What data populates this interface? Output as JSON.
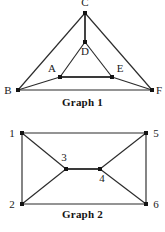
{
  "figure": {
    "background_color": "#ffffff",
    "line_color": "#2b2b2b",
    "vertex_color": "#141414",
    "label_color": "#1a1a1a",
    "width": 165,
    "height": 232
  },
  "graph_1": {
    "caption": "Graph 1",
    "vertices": [
      {
        "id": "C",
        "label": "C",
        "x": 85,
        "y": 13,
        "label_x": 85,
        "label_y": 6,
        "label_anchor": "middle"
      },
      {
        "id": "D",
        "label": "D",
        "x": 85,
        "y": 42,
        "label_x": 85,
        "label_y": 55,
        "label_anchor": "middle"
      },
      {
        "id": "A",
        "label": "A",
        "x": 60,
        "y": 77,
        "label_x": 52,
        "label_y": 72,
        "label_anchor": "middle"
      },
      {
        "id": "E",
        "label": "E",
        "x": 112,
        "y": 77,
        "label_x": 120,
        "label_y": 72,
        "label_anchor": "middle"
      },
      {
        "id": "B",
        "label": "B",
        "x": 18,
        "y": 90,
        "label_x": 8,
        "label_y": 94,
        "label_anchor": "middle"
      },
      {
        "id": "F",
        "label": "F",
        "x": 152,
        "y": 90,
        "label_x": 159,
        "label_y": 94,
        "label_anchor": "middle"
      }
    ],
    "edges": [
      {
        "from": "C",
        "to": "B",
        "style": "thin"
      },
      {
        "from": "C",
        "to": "F",
        "style": "thin"
      },
      {
        "from": "C",
        "to": "D",
        "style": "thick"
      },
      {
        "from": "D",
        "to": "A",
        "style": "thin"
      },
      {
        "from": "D",
        "to": "E",
        "style": "thin"
      },
      {
        "from": "A",
        "to": "E",
        "style": "thick"
      },
      {
        "from": "A",
        "to": "B",
        "style": "thin"
      },
      {
        "from": "E",
        "to": "F",
        "style": "thin"
      },
      {
        "from": "B",
        "to": "F",
        "style": "thin"
      }
    ]
  },
  "graph_2": {
    "caption": "Graph 2",
    "vertices": [
      {
        "id": "1",
        "label": "1",
        "x": 22,
        "y": 133,
        "label_x": 12,
        "label_y": 137,
        "label_anchor": "middle"
      },
      {
        "id": "5",
        "label": "5",
        "x": 146,
        "y": 133,
        "label_x": 156,
        "label_y": 137,
        "label_anchor": "middle"
      },
      {
        "id": "3",
        "label": "3",
        "x": 66,
        "y": 169,
        "label_x": 64,
        "label_y": 161,
        "label_anchor": "middle"
      },
      {
        "id": "4",
        "label": "4",
        "x": 100,
        "y": 169,
        "label_x": 102,
        "label_y": 182,
        "label_anchor": "middle"
      },
      {
        "id": "2",
        "label": "2",
        "x": 22,
        "y": 204,
        "label_x": 12,
        "label_y": 208,
        "label_anchor": "middle"
      },
      {
        "id": "6",
        "label": "6",
        "x": 146,
        "y": 204,
        "label_x": 156,
        "label_y": 208,
        "label_anchor": "middle"
      }
    ],
    "edges": [
      {
        "from": "1",
        "to": "5",
        "style": "thin"
      },
      {
        "from": "1",
        "to": "2",
        "style": "thin"
      },
      {
        "from": "5",
        "to": "6",
        "style": "thin"
      },
      {
        "from": "2",
        "to": "6",
        "style": "thin"
      },
      {
        "from": "1",
        "to": "3",
        "style": "thin"
      },
      {
        "from": "2",
        "to": "3",
        "style": "thin"
      },
      {
        "from": "3",
        "to": "4",
        "style": "thick"
      },
      {
        "from": "4",
        "to": "5",
        "style": "thin"
      },
      {
        "from": "4",
        "to": "6",
        "style": "thin"
      }
    ]
  }
}
